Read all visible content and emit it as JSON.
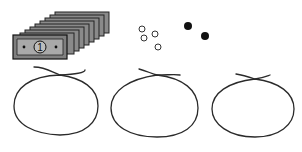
{
  "illustration": {
    "bills": {
      "count": 8,
      "front_bill_label": "1",
      "fill": "#8a8a8a",
      "inner_fill": "#a8a8a8",
      "stroke": "#222222"
    },
    "open_counters": {
      "count": 4,
      "stroke": "#333333"
    },
    "filled_counters": {
      "count": 2,
      "fill": "#111111"
    },
    "loops": {
      "count": 3,
      "stroke": "#2a2a2a"
    }
  }
}
